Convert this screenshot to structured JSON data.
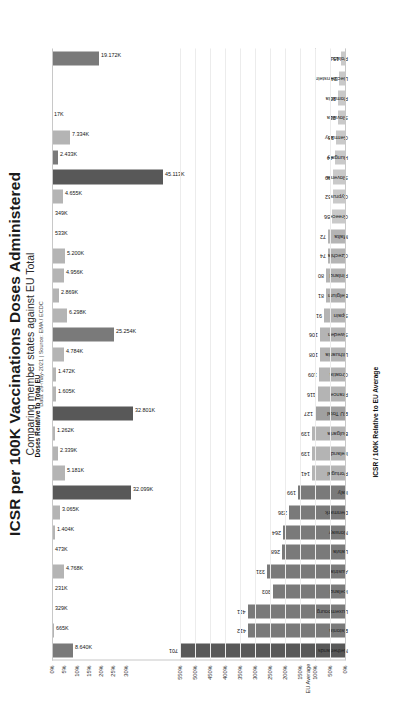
{
  "header": {
    "title": "ICSR per 100K Vaccinations Doses Administered",
    "subtitle": "Comparing member states against EU Total",
    "source": "Data: 29-may-2021 | Source: EMA / ECDC"
  },
  "axes": {
    "icsr_axis_title": "ICSR / 100K Relative to EU Average",
    "doses_axis_title": "Doses Relative to Total EU",
    "icsr_ticks": [
      "0%",
      "50%",
      "100%",
      "150%",
      "200%",
      "250%",
      "300%",
      "350%",
      "400%",
      "450%",
      "500%",
      "550%"
    ],
    "doses_ticks": [
      "0%",
      "5%",
      "10%",
      "15%",
      "20%",
      "25%",
      "30%"
    ],
    "eu_average_label": "EU Average"
  },
  "chart_data": {
    "type": "bar",
    "title": "ICSR per 100K Vaccinations Doses Administered",
    "subtitle": "Comparing member states against EU Total",
    "source": "Data: 29-may-2021 | Source: EMA / ECDC",
    "xlabel": "",
    "grid": true,
    "legend": "none",
    "categories": [
      "Netherlands",
      "Estonia",
      "Luxembourg",
      "Iceland",
      "Austria",
      "Latvia",
      "Norway",
      "Denmark",
      "Italy",
      "Portugal",
      "Ireland",
      "Bulgaria",
      "EU Total",
      "France",
      "Croatia",
      "Lithuania",
      "Sweden",
      "Spain",
      "Belgium",
      "Finland",
      "Czechia",
      "Malta",
      "Greece",
      "Cyprus",
      "Slovenia",
      "Hungary",
      "Germany",
      "Slovakia",
      "Romania",
      "Liechtenstein",
      "Poland"
    ],
    "series": [
      {
        "name": "ICSR / 100K Relative to EU Average",
        "ylabel": "ICSR / 100K Relative to EU Average",
        "ylim": [
          0,
          550
        ],
        "unit": "count",
        "axis": "bottom",
        "values": [
          701,
          412,
          411,
          303,
          331,
          268,
          264,
          236,
          199,
          141,
          139,
          139,
          127,
          116,
          109,
          108,
          106,
          91,
          81,
          80,
          74,
          72,
          56,
          52,
          49,
          44,
          38,
          31,
          30,
          24,
          15
        ],
        "labels": [
          "701",
          "412",
          "411",
          "303",
          "331",
          "268",
          "264",
          "236",
          "199",
          "141",
          "139",
          "139",
          "127",
          "116",
          "109",
          "108",
          "106",
          "91",
          "81",
          "80",
          "74",
          "72",
          "56",
          "52",
          "49",
          "44",
          "38",
          "31",
          "30",
          "24",
          "15"
        ]
      },
      {
        "name": "Doses Relative to Total EU",
        "ylabel": "Doses Relative to Total EU",
        "ylim": [
          0,
          30
        ],
        "unit": "doses",
        "axis": "top",
        "values": [
          8.64,
          0.665,
          0.329,
          0.231,
          4.768,
          0.473,
          1.404,
          3.065,
          32.099,
          5.181,
          2.339,
          1.262,
          32.801,
          1.605,
          1.472,
          4.784,
          25.254,
          6.298,
          2.869,
          4.956,
          5.2,
          0.533,
          0.496,
          4.655,
          2.433,
          7.334,
          0.017,
          null,
          null,
          null,
          19.172
        ],
        "labels": [
          "8.640K",
          "665K",
          "329K",
          "231K",
          "4.768K",
          "473K",
          "1.404K",
          "3.065K",
          "32.099K",
          "5.181K",
          "2.339K",
          "1.262K",
          "32.801K",
          "1.605K",
          "1.472K",
          "4.784K",
          "25.254K",
          "6.298K",
          "2.869K",
          "4.956K",
          "5.200K",
          "533K",
          "349K",
          "4.655K",
          "45.113K",
          "2.433K",
          "7.334K",
          "17K",
          "",
          "",
          "19.172K"
        ]
      }
    ],
    "eu_average_reference": 127
  },
  "bars": {
    "icsr": [
      {
        "country": "Netherlands",
        "value": 701,
        "label": "701",
        "tone": "dark"
      },
      {
        "country": "Estonia",
        "value": 412,
        "label": "412",
        "tone": "mid"
      },
      {
        "country": "Luxembourg",
        "value": 411,
        "label": "411",
        "tone": "mid"
      },
      {
        "country": "Iceland",
        "value": 303,
        "label": "303",
        "tone": "mid"
      },
      {
        "country": "Austria",
        "value": 331,
        "label": "331",
        "tone": "mid"
      },
      {
        "country": "Latvia",
        "value": 268,
        "label": "268",
        "tone": "mid"
      },
      {
        "country": "Norway",
        "value": 264,
        "label": "264",
        "tone": "mid"
      },
      {
        "country": "Denmark",
        "value": 236,
        "label": "236",
        "tone": "mid"
      },
      {
        "country": "Italy",
        "value": 199,
        "label": "199",
        "tone": "mid"
      },
      {
        "country": "Portugal",
        "value": 141,
        "label": "141",
        "tone": "light"
      },
      {
        "country": "Ireland",
        "value": 139,
        "label": "139",
        "tone": "light"
      },
      {
        "country": "Bulgaria",
        "value": 139,
        "label": "139",
        "tone": "light"
      },
      {
        "country": "EU Total",
        "value": 127,
        "label": "127",
        "tone": "eu"
      },
      {
        "country": "France",
        "value": 116,
        "label": "116",
        "tone": "light"
      },
      {
        "country": "Croatia",
        "value": 109,
        "label": "109",
        "tone": "light"
      },
      {
        "country": "Lithuania",
        "value": 108,
        "label": "108",
        "tone": "light"
      },
      {
        "country": "Sweden",
        "value": 106,
        "label": "106",
        "tone": "light"
      },
      {
        "country": "Spain",
        "value": 91,
        "label": "91",
        "tone": "light"
      },
      {
        "country": "Belgium",
        "value": 81,
        "label": "81",
        "tone": "light"
      },
      {
        "country": "Finland",
        "value": 80,
        "label": "80",
        "tone": "light"
      },
      {
        "country": "Czechia",
        "value": 74,
        "label": "74",
        "tone": "light"
      },
      {
        "country": "Malta",
        "value": 72,
        "label": "72",
        "tone": "light"
      },
      {
        "country": "Greece",
        "value": 56,
        "label": "56",
        "tone": "vlight"
      },
      {
        "country": "Cyprus",
        "value": 52,
        "label": "52",
        "tone": "vlight"
      },
      {
        "country": "Slovenia",
        "value": 49,
        "label": "49",
        "tone": "vlight"
      },
      {
        "country": "Hungary",
        "value": 44,
        "label": "44",
        "tone": "vlight"
      },
      {
        "country": "Germany",
        "value": 38,
        "label": "38",
        "tone": "vlight"
      },
      {
        "country": "Slovakia",
        "value": 31,
        "label": "31",
        "tone": "vlight"
      },
      {
        "country": "Romania",
        "value": 30,
        "label": "30",
        "tone": "vlight"
      },
      {
        "country": "Liechtenstein",
        "value": 24,
        "label": "24",
        "tone": "vlight"
      },
      {
        "country": "Poland",
        "value": 15,
        "label": "15",
        "tone": "vlight"
      }
    ],
    "doses": [
      {
        "country": "Netherlands",
        "pct": 8.64,
        "label": "8.640K",
        "tone": "mid"
      },
      {
        "country": "Estonia",
        "pct": 0.665,
        "label": "665K",
        "tone": "light"
      },
      {
        "country": "Luxembourg",
        "pct": 0.329,
        "label": "329K",
        "tone": "light"
      },
      {
        "country": "Iceland",
        "pct": 0.231,
        "label": "231K",
        "tone": "light"
      },
      {
        "country": "Austria",
        "pct": 4.768,
        "label": "4.768K",
        "tone": "light"
      },
      {
        "country": "Latvia",
        "pct": 0.473,
        "label": "473K",
        "tone": "light"
      },
      {
        "country": "Norway",
        "pct": 1.404,
        "label": "1.404K",
        "tone": "light"
      },
      {
        "country": "Denmark",
        "pct": 3.065,
        "label": "3.065K",
        "tone": "light"
      },
      {
        "country": "Italy",
        "pct": 32.099,
        "label": "32.099K",
        "tone": "dark"
      },
      {
        "country": "Portugal",
        "pct": 5.181,
        "label": "5.181K",
        "tone": "light"
      },
      {
        "country": "Ireland",
        "pct": 2.339,
        "label": "2.339K",
        "tone": "light"
      },
      {
        "country": "Bulgaria",
        "pct": 1.262,
        "label": "1.262K",
        "tone": "light"
      },
      {
        "country": "EU Total",
        "pct": 32.801,
        "label": "32.801K",
        "tone": "dark"
      },
      {
        "country": "France",
        "pct": 1.605,
        "label": "1.605K",
        "tone": "light"
      },
      {
        "country": "Croatia",
        "pct": 1.472,
        "label": "1.472K",
        "tone": "light"
      },
      {
        "country": "Lithuania",
        "pct": 4.784,
        "label": "4.784K",
        "tone": "light"
      },
      {
        "country": "Sweden",
        "pct": 25.254,
        "label": "25.254K",
        "tone": "mid"
      },
      {
        "country": "Spain",
        "pct": 6.298,
        "label": "6.298K",
        "tone": "light"
      },
      {
        "country": "Belgium",
        "pct": 2.869,
        "label": "2.869K",
        "tone": "light"
      },
      {
        "country": "Finland",
        "pct": 4.956,
        "label": "4.956K",
        "tone": "light"
      },
      {
        "country": "Czechia",
        "pct": 5.2,
        "label": "5.200K",
        "tone": "light"
      },
      {
        "country": "Malta",
        "pct": 0.533,
        "label": "533K",
        "tone": "light"
      },
      {
        "country": "Greece",
        "pct": 0.349,
        "label": "349K",
        "tone": "light"
      },
      {
        "country": "Cyprus",
        "pct": 4.655,
        "label": "4.655K",
        "tone": "light"
      },
      {
        "country": "Slovenia",
        "pct": 45.113,
        "label": "45.113K",
        "tone": "dark"
      },
      {
        "country": "Hungary",
        "pct": 2.433,
        "label": "2.433K",
        "tone": "mid"
      },
      {
        "country": "Germany",
        "pct": 7.334,
        "label": "7.334K",
        "tone": "light"
      },
      {
        "country": "Slovakia",
        "pct": 0.017,
        "label": "17K",
        "tone": "light"
      },
      {
        "country": "Romania",
        "pct": 0,
        "label": "",
        "tone": "light"
      },
      {
        "country": "Liechtenstein",
        "pct": 0,
        "label": "",
        "tone": "light"
      },
      {
        "country": "Poland",
        "pct": 19.172,
        "label": "19.172K",
        "tone": "mid"
      }
    ]
  }
}
